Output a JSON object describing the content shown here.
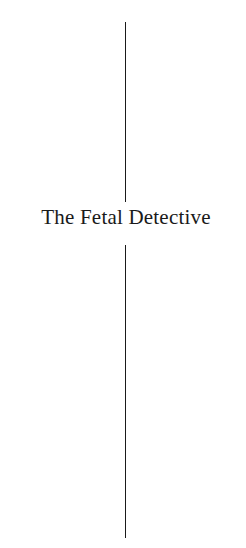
{
  "page": {
    "title": "The Fetal Detective"
  },
  "colors": {
    "background": "#ffffff",
    "text": "#1a1a1a",
    "rule": "#1a1a1a"
  }
}
